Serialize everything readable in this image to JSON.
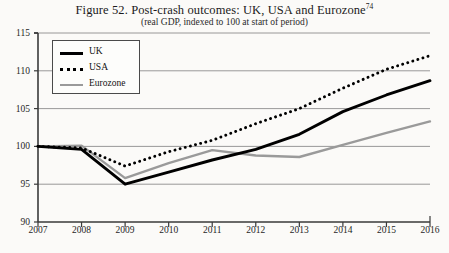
{
  "figure": {
    "title_prefix": "Figure 52. Post-crash outcomes: UK, USA and Eurozone",
    "title_superscript": "74",
    "subtitle": "(real GDP, indexed to 100 at start of period)"
  },
  "legend": {
    "items": [
      {
        "label": "UK",
        "swatch": "solid-thick-black",
        "color": "#000000"
      },
      {
        "label": "USA",
        "swatch": "dotted-black",
        "color": "#000000"
      },
      {
        "label": "Eurozone",
        "swatch": "solid-gray",
        "color": "#9a9a9a"
      }
    ]
  },
  "axes": {
    "y_ticks": [
      "115",
      "110",
      "105",
      "100",
      "95",
      "90"
    ],
    "x_ticks": [
      "2007",
      "2008",
      "2009",
      "2010",
      "2011",
      "2012",
      "2013",
      "2014",
      "2015",
      "2016"
    ]
  },
  "chart_data": {
    "type": "line",
    "title": "Figure 52. Post-crash outcomes: UK, USA and Eurozone",
    "subtitle": "(real GDP, indexed to 100 at start of period)",
    "xlabel": "",
    "ylabel": "",
    "x": [
      2007,
      2008,
      2009,
      2010,
      2011,
      2012,
      2013,
      2014,
      2015,
      2016
    ],
    "xlim": [
      2007,
      2016
    ],
    "ylim": [
      90,
      115
    ],
    "y_tick_values": [
      90,
      95,
      100,
      105,
      110,
      115
    ],
    "grid": "horizontal",
    "legend_position": "top-left",
    "series": [
      {
        "name": "UK",
        "style": "solid",
        "color": "#000000",
        "values": [
          100.0,
          99.6,
          95.0,
          96.6,
          98.2,
          99.6,
          101.6,
          104.6,
          106.8,
          108.7
        ]
      },
      {
        "name": "USA",
        "style": "dotted",
        "color": "#000000",
        "values": [
          100.0,
          99.8,
          97.4,
          99.3,
          100.8,
          103.0,
          105.0,
          107.7,
          110.2,
          112.0
        ]
      },
      {
        "name": "Eurozone",
        "style": "solid",
        "color": "#9a9a9a",
        "values": [
          100.0,
          100.1,
          95.8,
          97.8,
          99.5,
          98.8,
          98.6,
          100.2,
          101.8,
          103.3
        ]
      }
    ]
  },
  "plot_geometry": {
    "left": 38,
    "right": 430,
    "top": 33,
    "bottom": 222
  }
}
